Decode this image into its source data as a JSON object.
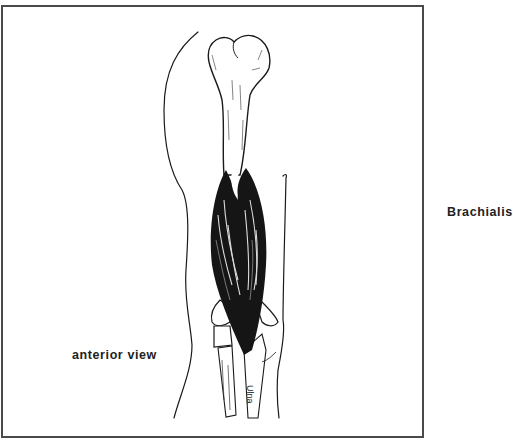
{
  "figure": {
    "title": "Brachialis",
    "view_label": "anterior view",
    "bone_label": "Ulna",
    "colors": {
      "frame": "#4a4a4a",
      "ink": "#1a1a1a",
      "background": "#ffffff"
    }
  }
}
